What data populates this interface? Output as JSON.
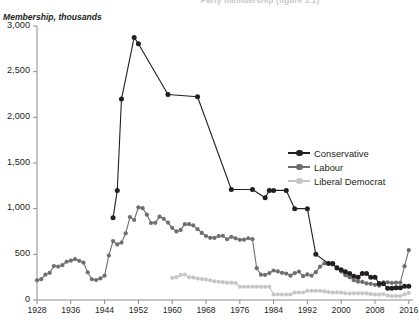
{
  "chart_title": "Party membership (figure 1.1)",
  "axis": {
    "ylabel": "Membership, thousands",
    "yticks": [
      "0",
      "500",
      "1,000",
      "1,500",
      "2,000",
      "2,500",
      "3,000"
    ],
    "xticks": [
      "1928",
      "1936",
      "1944",
      "1952",
      "1960",
      "1968",
      "1976",
      "1984",
      "1992",
      "2000",
      "2008",
      "2016"
    ]
  },
  "legend": {
    "items": [
      {
        "label": "Conservative",
        "color": "#231f20"
      },
      {
        "label": "Labour",
        "color": "#6e6e6e"
      },
      {
        "label": "Liberal Democrat",
        "color": "#c6c6c6"
      }
    ]
  },
  "chart_data": {
    "type": "line",
    "title": "Party membership (figure 1.1)",
    "xlabel": "",
    "ylabel": "Membership, thousands",
    "xlim": [
      1928,
      2017
    ],
    "ylim": [
      0,
      3000
    ],
    "yticks": [
      0,
      500,
      1000,
      1500,
      2000,
      2500,
      3000
    ],
    "xticks": [
      1928,
      1936,
      1944,
      1952,
      1960,
      1968,
      1976,
      1984,
      1992,
      2000,
      2008,
      2016
    ],
    "grid": false,
    "legend_position": "right-middle",
    "markers": true,
    "series": [
      {
        "name": "Conservative",
        "color": "#231f20",
        "x": [
          1946,
          1947,
          1948,
          1951,
          1952,
          1959,
          1966,
          1974,
          1979,
          1982,
          1983,
          1984,
          1987,
          1989,
          1992,
          1994,
          1997,
          1998,
          1999,
          2000,
          2001,
          2002,
          2003,
          2004,
          2005,
          2006,
          2007,
          2008,
          2009,
          2010,
          2011,
          2012,
          2013,
          2014,
          2015,
          2016
        ],
        "y": [
          900,
          1200,
          2200,
          2875,
          2805,
          2250,
          2225,
          1210,
          1210,
          1120,
          1200,
          1200,
          1200,
          1000,
          1000,
          500,
          400,
          400,
          350,
          330,
          310,
          290,
          260,
          250,
          290,
          290,
          250,
          250,
          180,
          177,
          130,
          130,
          134,
          134,
          150,
          150
        ]
      },
      {
        "name": "Labour",
        "color": "#6e6e6e",
        "x": [
          1928,
          1929,
          1930,
          1931,
          1932,
          1933,
          1934,
          1935,
          1936,
          1937,
          1938,
          1939,
          1940,
          1941,
          1942,
          1943,
          1944,
          1945,
          1946,
          1947,
          1948,
          1949,
          1950,
          1951,
          1952,
          1953,
          1954,
          1955,
          1956,
          1957,
          1958,
          1959,
          1960,
          1961,
          1962,
          1963,
          1964,
          1965,
          1966,
          1967,
          1968,
          1969,
          1970,
          1971,
          1972,
          1973,
          1974,
          1975,
          1976,
          1977,
          1978,
          1979,
          1980,
          1981,
          1982,
          1983,
          1984,
          1985,
          1986,
          1987,
          1988,
          1989,
          1990,
          1991,
          1992,
          1993,
          1994,
          1995,
          1996,
          1997,
          1998,
          1999,
          2000,
          2001,
          2002,
          2003,
          2004,
          2005,
          2006,
          2007,
          2008,
          2009,
          2010,
          2011,
          2012,
          2013,
          2014,
          2015,
          2016
        ],
        "y": [
          215,
          228,
          277,
          297,
          372,
          366,
          381,
          419,
          431,
          447,
          429,
          409,
          304,
          227,
          219,
          236,
          266,
          487,
          645,
          608,
          629,
          730,
          908,
          876,
          1015,
          1005,
          934,
          843,
          845,
          913,
          889,
          848,
          790,
          751,
          767,
          830,
          830,
          817,
          776,
          734,
          701,
          681,
          680,
          700,
          703,
          665,
          692,
          675,
          659,
          660,
          676,
          666,
          348,
          277,
          274,
          295,
          323,
          313,
          297,
          289,
          266,
          294,
          311,
          261,
          280,
          266,
          305,
          365,
          400,
          405,
          388,
          361,
          311,
          272,
          248,
          215,
          201,
          198,
          182,
          177,
          166,
          156,
          193,
          193,
          187,
          190,
          190,
          370,
          545
        ]
      },
      {
        "name": "Liberal Democrat",
        "color": "#c6c6c6",
        "x": [
          1960,
          1961,
          1962,
          1963,
          1964,
          1965,
          1966,
          1967,
          1968,
          1969,
          1970,
          1971,
          1972,
          1973,
          1974,
          1975,
          1976,
          1977,
          1978,
          1979,
          1980,
          1981,
          1982,
          1983,
          1984,
          1985,
          1986,
          1987,
          1988,
          1989,
          1990,
          1991,
          1992,
          1993,
          1994,
          1995,
          1996,
          1997,
          1998,
          1999,
          2000,
          2001,
          2002,
          2003,
          2004,
          2005,
          2006,
          2007,
          2008,
          2009,
          2010,
          2011,
          2012,
          2013,
          2014,
          2015,
          2016
        ],
        "y": [
          243,
          250,
          275,
          278,
          250,
          245,
          235,
          230,
          225,
          215,
          205,
          200,
          195,
          190,
          190,
          185,
          145,
          145,
          145,
          145,
          145,
          145,
          145,
          145,
          60,
          60,
          60,
          60,
          60,
          82,
          82,
          82,
          100,
          101,
          100,
          100,
          95,
          87,
          82,
          83,
          82,
          73,
          71,
          73,
          73,
          73,
          72,
          64,
          60,
          59,
          65,
          49,
          43,
          44,
          44,
          61,
          78
        ]
      }
    ]
  }
}
